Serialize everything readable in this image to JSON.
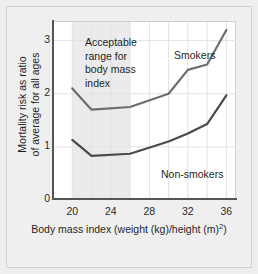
{
  "chart_data": {
    "type": "line",
    "title": "",
    "subtitle": "",
    "xlabel_text": "Body mass index (weight (kg)/height (m)",
    "xlabel_sup": "2",
    "xlabel_tail": ")",
    "xlabel_full": "Body mass index (weight (kg)/height (m)2)",
    "ylabel_line1": "Mortality risk as ratio",
    "ylabel_line2": "of average for all ages",
    "ylabel_full": "Mortality risk as ratio of average for all ages",
    "x": [
      20,
      22,
      26,
      30,
      32,
      34,
      36
    ],
    "xlim": [
      18,
      37
    ],
    "ylim": [
      0,
      3.35
    ],
    "xticks": [
      20,
      24,
      28,
      32,
      36
    ],
    "xtick_labels": [
      "20",
      "24",
      "28",
      "32",
      "36"
    ],
    "yticks": [
      0,
      1,
      2,
      3
    ],
    "ytick_labels": [
      "0",
      "1",
      "2",
      "3"
    ],
    "grid": true,
    "grid_color": "#e2e2e2",
    "legend_position": "inline-annotations",
    "series": [
      {
        "name": "Smokers",
        "label": "Smokers",
        "color": "#6e6e6e",
        "values": [
          2.1,
          1.7,
          1.75,
          2.0,
          2.45,
          2.55,
          3.2
        ]
      },
      {
        "name": "Non-smokers",
        "label": "Non-smokers",
        "color": "#4a4a4a",
        "values": [
          1.13,
          0.83,
          0.87,
          1.1,
          1.25,
          1.43,
          1.97
        ]
      }
    ],
    "shaded_band": {
      "label_line1": "Acceptable",
      "label_line2": "range for",
      "label_line3": "body mass",
      "label_line4": "index",
      "x_start": 20,
      "x_end": 26,
      "color": "#ebebeb"
    }
  },
  "annotation": {
    "line1": "Acceptable",
    "line2": "range for",
    "line3": "body mass",
    "line4": "index"
  },
  "axes": {
    "ytick_0": "0",
    "ytick_1": "1",
    "ytick_2": "2",
    "ytick_3": "3",
    "xtick_20": "20",
    "xtick_24": "24",
    "xtick_28": "28",
    "xtick_32": "32",
    "xtick_36": "36"
  },
  "labels": {
    "smokers": "Smokers",
    "nonsmokers": "Non-smokers"
  }
}
